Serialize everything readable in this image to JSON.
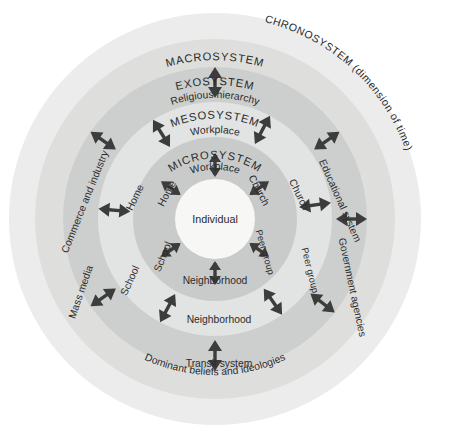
{
  "diagram": {
    "center": {
      "label": "Individual"
    },
    "rings": [
      {
        "id": "microsystem",
        "title": "MICROSYSTEM",
        "fill": "#c9cbcb",
        "labels": [
          "Workplace",
          "Church",
          "Peer group",
          "Neighborhood",
          "School",
          "Home"
        ]
      },
      {
        "id": "mesosystem",
        "title": "MESOSYSTEM",
        "fill": "#e2e3e3",
        "labels": [
          "Workplace",
          "Church",
          "Peer group",
          "Neighborhood",
          "School",
          "Home"
        ]
      },
      {
        "id": "exosystem",
        "title": "EXOSYSTEM",
        "fill": "#cdcfcf",
        "labels": [
          "Religious hierarchy",
          "Educational system",
          "Government agencies",
          "Transit system",
          "Mass media",
          "Commerce and industry"
        ]
      },
      {
        "id": "macrosystem",
        "title": "MACROSYSTEM",
        "fill": "#dededd",
        "labels": [
          "Dominant beliefs and ideologies"
        ]
      },
      {
        "id": "chronosystem",
        "title": "CHRONOSYSTEM (dimension of time)",
        "fill": "#ececec",
        "labels": []
      }
    ],
    "colors": {
      "background": "#ffffff",
      "core": "#f7f7f6",
      "arrow": "#3c3c3c",
      "text": "#2b2b2b"
    }
  }
}
